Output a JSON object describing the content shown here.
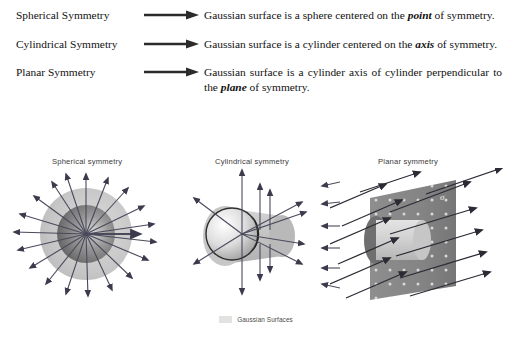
{
  "rules": [
    {
      "label": "Spherical Symmetry",
      "arrow_icon": "right-arrow-icon",
      "text_before": "Gaussian surface is a sphere centered on the ",
      "emphasis": "point",
      "text_after": " of symmetry.",
      "justified": false
    },
    {
      "label": "Cylindrical Symmetry",
      "arrow_icon": "right-arrow-icon",
      "text_before": "Gaussian surface is a cylinder centered on the ",
      "emphasis": "axis",
      "text_after": " of symmetry.",
      "justified": false
    },
    {
      "label": "Planar Symmetry",
      "arrow_icon": "right-arrow-icon",
      "text_before": "Gaussian surface is a cylinder axis of cylinder perpendicular to the ",
      "emphasis": "plane",
      "text_after": " of symmetry.",
      "justified": true
    }
  ],
  "figures": [
    {
      "label": "Spherical symmetry",
      "id": "spherical"
    },
    {
      "label": "Cylindrical symmetry",
      "id": "cylindrical"
    },
    {
      "label": "Planar symmetry",
      "id": "planar"
    }
  ],
  "planar_annotation": "σ",
  "legend": {
    "swatch_color": "#e2e2e2",
    "text": "Gaussian Surfaces"
  },
  "colors": {
    "background": "#ffffff",
    "text": "#111111",
    "figure_label": "#3a3a3a",
    "arrow_stroke": "#2b2b2b",
    "gaussian_surface": "#c9c9c9",
    "charge_dark": "#6e6e6e",
    "plane_fill": "#8a8a8a"
  }
}
